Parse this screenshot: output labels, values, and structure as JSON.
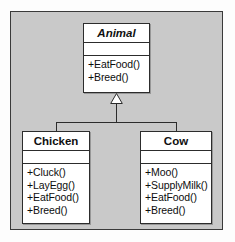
{
  "diagram": {
    "type": "uml-class-diagram",
    "relationship": "generalization",
    "colors": {
      "canvas_background": "#c9c9c9",
      "box_fill": "#ffffff",
      "line": "#2c2c2c",
      "text": "#0d0d0d"
    },
    "classes": [
      {
        "id": "animal",
        "name": "Animal",
        "abstract": true,
        "attributes": [],
        "operations": [
          "+EatFood()",
          "+Breed()"
        ]
      },
      {
        "id": "chicken",
        "name": "Chicken",
        "abstract": false,
        "attributes": [],
        "operations": [
          "+Cluck()",
          "+LayEgg()",
          "+EatFood()",
          "+Breed()"
        ]
      },
      {
        "id": "cow",
        "name": "Cow",
        "abstract": false,
        "attributes": [],
        "operations": [
          "+Moo()",
          "+SupplyMilk()",
          "+EatFood()",
          "+Breed()"
        ]
      }
    ],
    "connectors": [
      {
        "from": "chicken",
        "to": "animal",
        "kind": "generalization",
        "arrow": "hollow-triangle"
      },
      {
        "from": "cow",
        "to": "animal",
        "kind": "generalization",
        "arrow": "hollow-triangle"
      }
    ]
  }
}
